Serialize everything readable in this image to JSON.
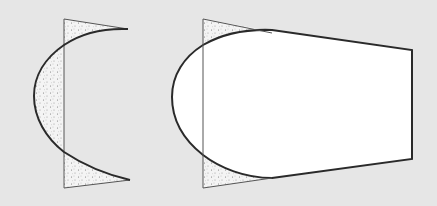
{
  "diagram": {
    "background": "#e6e6e6",
    "stroke": "#2a2a2a",
    "fill_white": "#ffffff",
    "stipple_base": "#f4f4f4",
    "stipple_dot": "#777777",
    "figures": [
      {
        "name": "crescent-figure",
        "description": "Vertical line with curved arc; stippled regions between line and arc"
      },
      {
        "name": "truncated-shape-figure",
        "description": "Rounded-front quadrilateral overlapping vertical line; stippled triangle corners"
      }
    ]
  }
}
